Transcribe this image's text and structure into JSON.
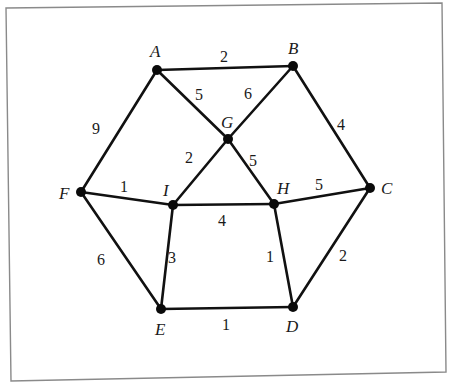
{
  "diagram": {
    "type": "weighted-undirected-graph",
    "nodes": [
      {
        "id": "A",
        "label": "A",
        "x": 157,
        "y": 70,
        "lx": 150,
        "ly": 57
      },
      {
        "id": "B",
        "label": "B",
        "x": 293,
        "y": 66,
        "lx": 288,
        "ly": 54
      },
      {
        "id": "C",
        "label": "C",
        "x": 370,
        "y": 188,
        "lx": 381,
        "ly": 194
      },
      {
        "id": "D",
        "label": "D",
        "x": 293,
        "y": 307,
        "lx": 286,
        "ly": 332
      },
      {
        "id": "E",
        "label": "E",
        "x": 161,
        "y": 309,
        "lx": 155,
        "ly": 335
      },
      {
        "id": "F",
        "label": "F",
        "x": 81,
        "y": 192,
        "lx": 59,
        "ly": 199
      },
      {
        "id": "G",
        "label": "G",
        "x": 228,
        "y": 139,
        "lx": 221,
        "ly": 128
      },
      {
        "id": "H",
        "label": "H",
        "x": 274,
        "y": 204,
        "lx": 277,
        "ly": 194
      },
      {
        "id": "I",
        "label": "I",
        "x": 173,
        "y": 205,
        "lx": 163,
        "ly": 196
      }
    ],
    "edges": [
      {
        "from": "A",
        "to": "B",
        "weight": "2",
        "wx": 224,
        "wy": 62
      },
      {
        "from": "A",
        "to": "G",
        "weight": "5",
        "wx": 199,
        "wy": 100
      },
      {
        "from": "B",
        "to": "G",
        "weight": "6",
        "wx": 248,
        "wy": 99
      },
      {
        "from": "B",
        "to": "C",
        "weight": "4",
        "wx": 341,
        "wy": 130
      },
      {
        "from": "A",
        "to": "F",
        "weight": "9",
        "wx": 96,
        "wy": 134
      },
      {
        "from": "G",
        "to": "I",
        "weight": "2",
        "wx": 189,
        "wy": 163
      },
      {
        "from": "G",
        "to": "H",
        "weight": "5",
        "wx": 253,
        "wy": 166
      },
      {
        "from": "F",
        "to": "I",
        "weight": "1",
        "wx": 124,
        "wy": 192
      },
      {
        "from": "I",
        "to": "H",
        "weight": "4",
        "wx": 222,
        "wy": 226
      },
      {
        "from": "H",
        "to": "C",
        "weight": "5",
        "wx": 319,
        "wy": 190
      },
      {
        "from": "F",
        "to": "E",
        "weight": "6",
        "wx": 101,
        "wy": 265
      },
      {
        "from": "I",
        "to": "E",
        "weight": "3",
        "wx": 172,
        "wy": 263
      },
      {
        "from": "H",
        "to": "D",
        "weight": "1",
        "wx": 270,
        "wy": 262
      },
      {
        "from": "C",
        "to": "D",
        "weight": "2",
        "wx": 343,
        "wy": 261
      },
      {
        "from": "E",
        "to": "D",
        "weight": "1",
        "wx": 226,
        "wy": 330
      }
    ],
    "frame": {
      "points": "6,8 442,3 446,372 11,381"
    }
  }
}
